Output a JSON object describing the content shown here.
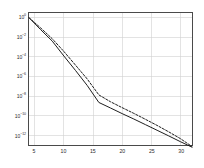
{
  "chart_data": {
    "type": "line",
    "title": "",
    "subtitle": "",
    "xlabel": "",
    "ylabel": "",
    "yscale": "log",
    "xscale": "linear",
    "xlim": [
      4,
      32
    ],
    "ylim": [
      1e-13,
      3
    ],
    "grid": true,
    "legend_position": "none",
    "xticks": [
      5,
      10,
      15,
      20,
      25,
      30
    ],
    "xtick_labels": [
      "5",
      "10",
      "15",
      "20",
      "25",
      "30"
    ],
    "yticks": [
      1,
      0.01,
      0.0001,
      1e-06,
      1e-08,
      1e-10,
      1e-12
    ],
    "ytick_labels": [
      "10^0",
      "10^-2",
      "10^-4",
      "10^-6",
      "10^-8",
      "10^-10",
      "10^-12"
    ],
    "ytick_mantissa": "10",
    "ytick_exponents": [
      "0",
      "-2",
      "-4",
      "-6",
      "-8",
      "-10",
      "-12"
    ],
    "series": [
      {
        "name": "solid-curve",
        "style": "solid",
        "color": "#1a1a1a",
        "width": 1.0,
        "x": [
          4,
          6,
          8,
          10,
          12,
          14,
          16,
          18,
          20,
          22,
          24,
          26,
          28,
          30,
          32
        ],
        "y": [
          1.0,
          0.06,
          0.004,
          0.00012,
          4e-06,
          1.2e-07,
          2.2e-09,
          6e-10,
          1.6e-10,
          4.5e-11,
          1.2e-11,
          3.2e-12,
          8.5e-13,
          2.2e-13,
          6e-14
        ]
      },
      {
        "name": "dashed-curve",
        "style": "dashed",
        "color": "#1a1a1a",
        "width": 1.0,
        "x": [
          4,
          6,
          8,
          10,
          12,
          14,
          16,
          18,
          20,
          22,
          24,
          26,
          28,
          30,
          32
        ],
        "y": [
          1.0,
          0.09,
          0.007,
          0.00035,
          1.4e-05,
          5.5e-07,
          1.3e-08,
          2.6e-09,
          6.5e-10,
          1.7e-10,
          4.2e-11,
          1e-11,
          2.2e-12,
          4.5e-13,
          7e-14
        ]
      }
    ]
  },
  "axes": {
    "frame_color": "#4a4a4a",
    "grid_color": "#cfcfcf",
    "background": "#ffffff",
    "tick_color": "#2b2b2b"
  }
}
